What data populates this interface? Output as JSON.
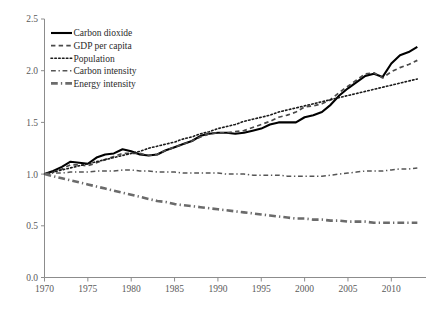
{
  "chart_data": {
    "type": "line",
    "title": "",
    "subtitle": "",
    "xlabel": "",
    "ylabel": "",
    "xlim": [
      1970,
      2014
    ],
    "ylim": [
      0.0,
      2.5
    ],
    "grid": false,
    "legend_position": "top-left",
    "index_base_year": 1970,
    "index_base_value": 1.0,
    "yticks": [
      "0.0",
      "0.5",
      "1.0",
      "1.5",
      "2.0",
      "2.5"
    ],
    "ytick_values": [
      0.0,
      0.5,
      1.0,
      1.5,
      2.0,
      2.5
    ],
    "xticks": [
      "1970",
      "1975",
      "1980",
      "1985",
      "1990",
      "1995",
      "2000",
      "2005",
      "2010"
    ],
    "xtick_values": [
      1970,
      1975,
      1980,
      1985,
      1990,
      1995,
      2000,
      2005,
      2010
    ],
    "x": [
      1970,
      1971,
      1972,
      1973,
      1974,
      1975,
      1976,
      1977,
      1978,
      1979,
      1980,
      1981,
      1982,
      1983,
      1984,
      1985,
      1986,
      1987,
      1988,
      1989,
      1990,
      1991,
      1992,
      1993,
      1994,
      1995,
      1996,
      1997,
      1998,
      1999,
      2000,
      2001,
      2002,
      2003,
      2004,
      2005,
      2006,
      2007,
      2008,
      2009,
      2010,
      2011,
      2012,
      2013
    ],
    "series": [
      {
        "name": "Carbon dioxide",
        "style": "solid",
        "color": "#000000",
        "width": 2.1,
        "values": [
          1.0,
          1.03,
          1.07,
          1.12,
          1.11,
          1.1,
          1.16,
          1.19,
          1.2,
          1.24,
          1.22,
          1.19,
          1.18,
          1.19,
          1.23,
          1.26,
          1.29,
          1.32,
          1.37,
          1.39,
          1.4,
          1.4,
          1.39,
          1.4,
          1.42,
          1.44,
          1.48,
          1.5,
          1.5,
          1.5,
          1.55,
          1.57,
          1.6,
          1.67,
          1.76,
          1.83,
          1.89,
          1.95,
          1.97,
          1.94,
          2.07,
          2.15,
          2.18,
          2.23
        ]
      },
      {
        "name": "GDP per capita",
        "style": "dashed",
        "color": "#4a4a4a",
        "width": 1.7,
        "values": [
          1.0,
          1.02,
          1.05,
          1.09,
          1.09,
          1.08,
          1.11,
          1.14,
          1.17,
          1.2,
          1.2,
          1.2,
          1.18,
          1.19,
          1.23,
          1.26,
          1.29,
          1.32,
          1.36,
          1.39,
          1.4,
          1.4,
          1.41,
          1.42,
          1.45,
          1.48,
          1.51,
          1.55,
          1.57,
          1.6,
          1.65,
          1.66,
          1.68,
          1.72,
          1.79,
          1.85,
          1.91,
          1.97,
          1.98,
          1.93,
          1.99,
          2.03,
          2.06,
          2.1
        ]
      },
      {
        "name": "Population",
        "style": "dotted",
        "color": "#1a1a1a",
        "width": 1.6,
        "values": [
          1.0,
          1.02,
          1.04,
          1.06,
          1.08,
          1.1,
          1.12,
          1.14,
          1.16,
          1.18,
          1.2,
          1.22,
          1.25,
          1.27,
          1.29,
          1.31,
          1.34,
          1.36,
          1.39,
          1.41,
          1.44,
          1.46,
          1.48,
          1.51,
          1.53,
          1.55,
          1.57,
          1.6,
          1.62,
          1.64,
          1.66,
          1.68,
          1.7,
          1.72,
          1.74,
          1.76,
          1.78,
          1.8,
          1.82,
          1.84,
          1.86,
          1.88,
          1.9,
          1.92
        ]
      },
      {
        "name": "Carbon intensity",
        "style": "dashdot",
        "color": "#555555",
        "width": 1.5,
        "values": [
          1.0,
          1.01,
          1.01,
          1.02,
          1.02,
          1.02,
          1.03,
          1.03,
          1.03,
          1.04,
          1.04,
          1.03,
          1.03,
          1.02,
          1.02,
          1.02,
          1.01,
          1.01,
          1.01,
          1.01,
          1.01,
          1.0,
          1.0,
          1.0,
          0.99,
          0.99,
          0.99,
          0.99,
          0.98,
          0.98,
          0.98,
          0.98,
          0.98,
          0.99,
          1.0,
          1.01,
          1.02,
          1.03,
          1.03,
          1.03,
          1.04,
          1.05,
          1.05,
          1.06
        ]
      },
      {
        "name": "Energy intensity",
        "style": "dashdot-thick",
        "color": "#6b6b6b",
        "width": 2.6,
        "values": [
          1.0,
          0.98,
          0.96,
          0.94,
          0.92,
          0.9,
          0.88,
          0.86,
          0.84,
          0.82,
          0.8,
          0.78,
          0.76,
          0.74,
          0.73,
          0.71,
          0.7,
          0.69,
          0.68,
          0.67,
          0.66,
          0.65,
          0.64,
          0.63,
          0.62,
          0.61,
          0.6,
          0.59,
          0.58,
          0.57,
          0.57,
          0.56,
          0.56,
          0.55,
          0.55,
          0.54,
          0.54,
          0.54,
          0.53,
          0.53,
          0.53,
          0.53,
          0.53,
          0.53
        ]
      }
    ]
  },
  "legend": {
    "items": [
      {
        "label": "Carbon dioxide"
      },
      {
        "label": "GDP per capita"
      },
      {
        "label": "Population"
      },
      {
        "label": "Carbon intensity"
      },
      {
        "label": "Energy intensity"
      }
    ]
  },
  "axes": {
    "axis_color": "#8c8c8c",
    "tick_color": "#5a5a5a"
  }
}
